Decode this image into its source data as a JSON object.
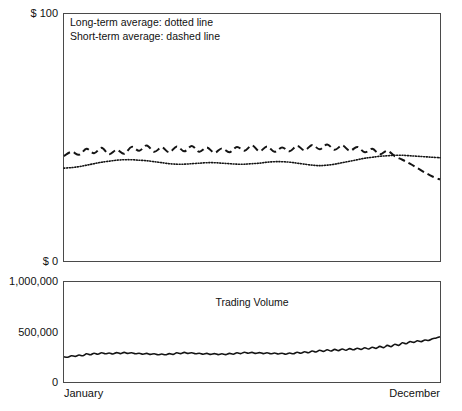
{
  "chart_data": {
    "type": "line",
    "title": "",
    "panels": [
      {
        "name": "price-panel",
        "ylabel": "",
        "ylim": [
          0,
          100
        ],
        "ytick_labels": [
          "$ 100",
          "$ 0"
        ],
        "ytick_values": [
          100,
          0
        ],
        "grid": false,
        "annotations": [
          "Long-term average: dotted line",
          "Short-term average: dashed line"
        ],
        "series": [
          {
            "name": "Short-term average",
            "style": "dashed",
            "x": [
              0,
              2,
              4,
              6,
              8,
              10,
              12,
              14,
              16,
              18,
              20,
              22,
              24,
              26,
              28,
              30,
              32,
              34,
              36,
              38,
              40,
              42,
              44,
              46,
              48,
              50,
              52,
              54,
              56,
              58,
              60,
              62,
              64,
              66,
              68,
              70,
              72,
              74,
              76,
              78,
              80,
              82,
              84,
              86,
              88,
              90,
              92,
              94,
              96,
              98,
              100
            ],
            "values": [
              42.5,
              44.2,
              43.0,
              45.4,
              43.6,
              45.8,
              43.2,
              45.0,
              43.4,
              46.2,
              44.6,
              46.8,
              44.2,
              46.0,
              44.0,
              46.4,
              44.4,
              46.6,
              44.2,
              46.0,
              43.8,
              45.6,
              44.0,
              46.2,
              44.6,
              46.8,
              44.4,
              46.4,
              44.2,
              46.0,
              44.4,
              46.6,
              44.8,
              47.0,
              45.2,
              47.2,
              45.0,
              46.8,
              44.6,
              46.2,
              44.0,
              45.4,
              43.2,
              44.6,
              42.4,
              41.0,
              39.4,
              37.6,
              35.8,
              34.2,
              33.0
            ]
          },
          {
            "name": "Long-term average",
            "style": "dotted",
            "x": [
              0,
              2,
              4,
              6,
              8,
              10,
              12,
              14,
              16,
              18,
              20,
              22,
              24,
              26,
              28,
              30,
              32,
              34,
              36,
              38,
              40,
              42,
              44,
              46,
              48,
              50,
              52,
              54,
              56,
              58,
              60,
              62,
              64,
              66,
              68,
              70,
              72,
              74,
              76,
              78,
              80,
              82,
              84,
              86,
              88,
              90,
              92,
              94,
              96,
              98,
              100
            ],
            "values": [
              37.6,
              37.8,
              38.2,
              38.8,
              39.4,
              40.0,
              40.4,
              40.8,
              41.0,
              41.0,
              40.8,
              40.6,
              40.2,
              39.8,
              39.4,
              39.2,
              39.2,
              39.4,
              39.6,
              39.8,
              39.8,
              39.6,
              39.4,
              39.2,
              39.2,
              39.4,
              39.6,
              40.0,
              40.2,
              40.2,
              40.0,
              39.6,
              39.2,
              38.8,
              38.6,
              38.8,
              39.2,
              39.8,
              40.4,
              41.0,
              41.6,
              42.0,
              42.4,
              42.6,
              42.8,
              42.8,
              42.6,
              42.4,
              42.2,
              42.0,
              41.8
            ]
          }
        ]
      },
      {
        "name": "volume-panel",
        "ylabel": "",
        "ylim": [
          0,
          1000000
        ],
        "ytick_labels": [
          "1,000,000",
          "500,000",
          "0"
        ],
        "ytick_values": [
          1000000,
          500000,
          0
        ],
        "grid": false,
        "series_label": "Trading Volume",
        "series": [
          {
            "name": "Trading Volume",
            "style": "solid",
            "x": [
              0,
              1,
              2,
              3,
              4,
              5,
              6,
              7,
              8,
              9,
              10,
              11,
              12,
              13,
              14,
              15,
              16,
              17,
              18,
              19,
              20,
              21,
              22,
              23,
              24,
              25,
              26,
              27,
              28,
              29,
              30,
              31,
              32,
              33,
              34,
              35,
              36,
              37,
              38,
              39,
              40,
              41,
              42,
              43,
              44,
              45,
              46,
              47,
              48,
              49,
              50,
              51,
              52,
              53,
              54,
              55,
              56,
              57,
              58,
              59,
              60,
              61,
              62,
              63,
              64,
              65,
              66,
              67,
              68,
              69,
              70,
              71,
              72,
              73,
              74,
              75,
              76,
              77,
              78,
              79,
              80,
              81,
              82,
              83,
              84,
              85,
              86,
              87,
              88,
              89,
              90,
              91,
              92,
              93,
              94,
              95,
              96,
              97,
              98,
              99,
              100
            ],
            "values": [
              252000,
              248000,
              262000,
              256000,
              270000,
              262000,
              282000,
              272000,
              288000,
              278000,
              292000,
              282000,
              290000,
              280000,
              294000,
              284000,
              296000,
              286000,
              292000,
              282000,
              288000,
              278000,
              286000,
              276000,
              282000,
              272000,
              280000,
              272000,
              284000,
              276000,
              292000,
              284000,
              296000,
              286000,
              292000,
              282000,
              288000,
              278000,
              286000,
              276000,
              284000,
              274000,
              282000,
              274000,
              286000,
              278000,
              292000,
              284000,
              298000,
              288000,
              296000,
              286000,
              294000,
              284000,
              292000,
              282000,
              290000,
              280000,
              288000,
              278000,
              290000,
              282000,
              298000,
              288000,
              302000,
              292000,
              310000,
              300000,
              318000,
              306000,
              322000,
              310000,
              326000,
              314000,
              330000,
              318000,
              334000,
              322000,
              338000,
              326000,
              342000,
              330000,
              348000,
              336000,
              356000,
              344000,
              366000,
              354000,
              378000,
              366000,
              392000,
              382000,
              404000,
              396000,
              412000,
              404000,
              420000,
              416000,
              432000,
              440000,
              452000
            ]
          }
        ]
      }
    ],
    "xlabel": "",
    "xtick_labels": [
      "January",
      "December"
    ],
    "x_start": "January",
    "x_end": "December"
  },
  "axes": {
    "price_top_label": "$ 100",
    "price_bottom_label": "$ 0",
    "volume_top_label": "1,000,000",
    "volume_mid_label": "500,000",
    "volume_zero_label": "0",
    "x_left_label": "January",
    "x_right_label": "December"
  },
  "legend": {
    "line1": "Long-term average: dotted line",
    "line2": "Short-term average: dashed line"
  },
  "labels": {
    "trading_volume": "Trading Volume"
  },
  "colors": {
    "ink": "#141414",
    "frame": "#4a4a4a",
    "background": "#ffffff"
  }
}
